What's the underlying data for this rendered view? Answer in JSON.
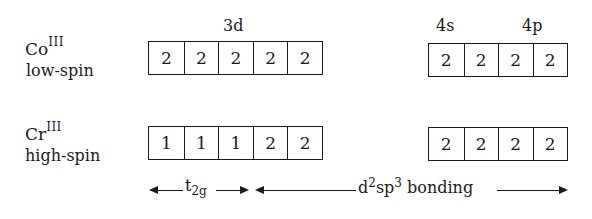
{
  "orbital_labels": {
    "d3": "3d",
    "s4": "4s",
    "p4": "4p"
  },
  "rows": [
    {
      "ion": "Co",
      "oxidation": "III",
      "spin": "low-spin",
      "d_electrons": [
        "2",
        "2",
        "2",
        "2",
        "2"
      ],
      "sp_electrons": [
        "2",
        "2",
        "2",
        "2"
      ]
    },
    {
      "ion": "Cr",
      "oxidation": "III",
      "spin": "high-spin",
      "d_electrons": [
        "1",
        "1",
        "1",
        "2",
        "2"
      ],
      "sp_electrons": [
        "2",
        "2",
        "2",
        "2"
      ]
    }
  ],
  "bracket": {
    "t_main": "t",
    "t_sub": "2g",
    "bond_d": "d",
    "bond_d_sup": "2",
    "bond_sp": "sp",
    "bond_sp_sup": "3",
    "bond_word": " bonding"
  }
}
